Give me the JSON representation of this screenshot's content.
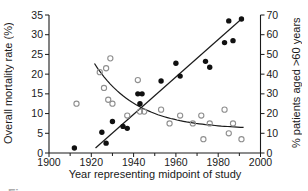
{
  "page": {
    "background": "#ffffff"
  },
  "footer": {
    "partial_caption": "Figure"
  },
  "chart_data": {
    "type": "scatter",
    "title": "",
    "xlabel": "Year representing midpoint of study",
    "ylabel_left": "Overall mortality rate (%)",
    "ylabel_right": "% patients aged >60 years",
    "xlim": [
      1900,
      2000
    ],
    "ylim_left": [
      0,
      35
    ],
    "ylim_right": [
      0,
      70
    ],
    "x_major_ticks": [
      1900,
      1920,
      1940,
      1960,
      1980,
      2000
    ],
    "x_minor_ticks": [
      1910,
      1930,
      1950,
      1970,
      1990
    ],
    "y_left_ticks": [
      0,
      5,
      10,
      15,
      20,
      25,
      30,
      35
    ],
    "y_right_ticks": [
      0,
      10,
      20,
      30,
      40,
      50,
      60,
      70
    ],
    "grid": false,
    "legend": "none",
    "axis_color": "#1a1a1a",
    "series": [
      {
        "name": "percent of patients aged over 60 years",
        "marker": "filled-circle",
        "axis": "right",
        "color": "#111111",
        "points": [
          [
            1912,
            2.5
          ],
          [
            1925,
            10.5
          ],
          [
            1927,
            5
          ],
          [
            1930,
            16
          ],
          [
            1935,
            13.5
          ],
          [
            1937,
            12.5
          ],
          [
            1942,
            30
          ],
          [
            1943,
            25
          ],
          [
            1944,
            30
          ],
          [
            1953,
            36.5
          ],
          [
            1960,
            45.5
          ],
          [
            1962,
            39
          ],
          [
            1974,
            46.5
          ],
          [
            1976,
            43.5
          ],
          [
            1983,
            56
          ],
          [
            1985,
            67
          ],
          [
            1987,
            57
          ],
          [
            1991,
            68
          ]
        ]
      },
      {
        "name": "overall mortality rate",
        "marker": "open-circle",
        "axis": "left",
        "color": "#8f8f8f",
        "points": [
          [
            1913,
            12.5
          ],
          [
            1924,
            20.5
          ],
          [
            1926,
            16.5
          ],
          [
            1927,
            21.5
          ],
          [
            1928,
            13.5
          ],
          [
            1929,
            24
          ],
          [
            1930,
            12.5
          ],
          [
            1937,
            9.5
          ],
          [
            1942,
            18.5
          ],
          [
            1943,
            10.5
          ],
          [
            1945,
            10.5
          ],
          [
            1953,
            11
          ],
          [
            1957,
            7.5
          ],
          [
            1962,
            9.5
          ],
          [
            1968,
            7.5
          ],
          [
            1972,
            9.5
          ],
          [
            1973,
            3.5
          ],
          [
            1976,
            7.5
          ],
          [
            1983,
            11
          ],
          [
            1985,
            5
          ],
          [
            1987,
            7.5
          ],
          [
            1991,
            3.5
          ]
        ]
      }
    ],
    "fits": [
      {
        "name": "rising-linear-fit",
        "type": "line",
        "axis": "right",
        "color": "#1a1a1a",
        "x1": 1922,
        "y1": 2.5,
        "x2": 1991,
        "y2": 68
      },
      {
        "name": "falling-decay-fit",
        "type": "exp_decay",
        "axis": "left",
        "color": "#1a1a1a",
        "start_year": 1921.5,
        "end_year": 1992,
        "base": 6,
        "amplitude": 18,
        "tau_years": 20
      }
    ]
  }
}
